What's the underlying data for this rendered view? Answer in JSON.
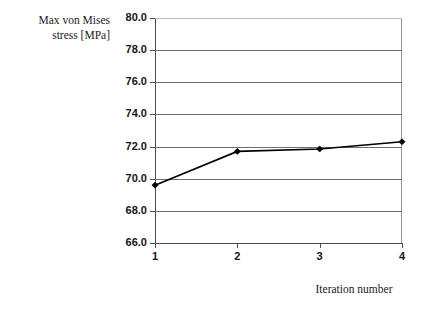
{
  "figure": {
    "background_color": "#ffffff",
    "axis_color": "#4d4d4d",
    "gridline_color": "#6f6f6f",
    "series_color": "#000000"
  },
  "chart_data": {
    "type": "line",
    "title": "",
    "xlabel": "Iteration number",
    "ylabel": "Max von Mises\nstress [MPa]",
    "ylabel_lines": [
      "Max von Mises",
      "stress [MPa]"
    ],
    "x": [
      1,
      2,
      3,
      4
    ],
    "categories": [
      "1",
      "2",
      "3",
      "4"
    ],
    "values": [
      69.6,
      71.7,
      71.85,
      72.3
    ],
    "series": [
      {
        "name": "Max von Mises stress",
        "values": [
          69.6,
          71.7,
          71.85,
          72.3
        ],
        "color": "#000000",
        "marker": "diamond",
        "line_width": 1.6
      }
    ],
    "xlim": [
      1,
      4
    ],
    "ylim": [
      66.0,
      80.0
    ],
    "ytick_step": 2.0,
    "ytick_labels": [
      "80.0",
      "78.0",
      "76.0",
      "74.0",
      "72.0",
      "70.0",
      "68.0",
      "66.0"
    ],
    "ytick_values": [
      80.0,
      78.0,
      76.0,
      74.0,
      72.0,
      70.0,
      68.0,
      66.0
    ],
    "xtick_labels": [
      "1",
      "2",
      "3",
      "4"
    ],
    "xtick_values": [
      1,
      2,
      3,
      4
    ],
    "grid": true,
    "grid_axis": "y",
    "legend": false,
    "legend_position": "none"
  }
}
